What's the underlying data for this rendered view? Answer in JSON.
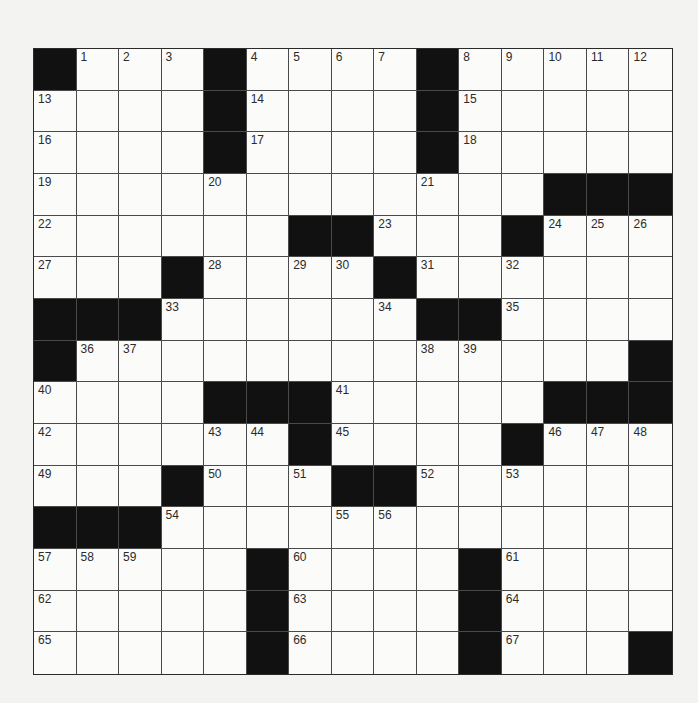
{
  "puzzle": {
    "rows": 15,
    "cols": 15,
    "grid": [
      [
        "#",
        "1",
        "2",
        "3",
        "#",
        "4",
        "5",
        "6",
        "7",
        "#",
        "8",
        "9",
        "10",
        "11",
        "12"
      ],
      [
        "13",
        "",
        "",
        "",
        "#",
        "14",
        "",
        "",
        "",
        "#",
        "15",
        "",
        "",
        "",
        ""
      ],
      [
        "16",
        "",
        "",
        "",
        "#",
        "17",
        "",
        "",
        "",
        "#",
        "18",
        "",
        "",
        "",
        ""
      ],
      [
        "19",
        "",
        "",
        "",
        "20",
        "",
        "",
        "",
        "",
        "21",
        "",
        "",
        "#",
        "#",
        "#"
      ],
      [
        "22",
        "",
        "",
        "",
        "",
        "",
        "#",
        "#",
        "23",
        "",
        "",
        "#",
        "24",
        "25",
        "26"
      ],
      [
        "27",
        "",
        "",
        "#",
        "28",
        "",
        "29",
        "30",
        "#",
        "31",
        "",
        "32",
        "",
        "",
        ""
      ],
      [
        "#",
        "#",
        "#",
        "33",
        "",
        "",
        "",
        "",
        "34",
        "#",
        "#",
        "35",
        "",
        "",
        ""
      ],
      [
        "#",
        "36",
        "37",
        "",
        "",
        "",
        "",
        "",
        "",
        "38",
        "39",
        "",
        "",
        "",
        "#"
      ],
      [
        "40",
        "",
        "",
        "",
        "#",
        "#",
        "#",
        "41",
        "",
        "",
        "",
        "",
        "#",
        "#",
        "#"
      ],
      [
        "42",
        "",
        "",
        "",
        "43",
        "44",
        "#",
        "45",
        "",
        "",
        "",
        "#",
        "46",
        "47",
        "48"
      ],
      [
        "49",
        "",
        "",
        "#",
        "50",
        "",
        "51",
        "#",
        "#",
        "52",
        "",
        "53",
        "",
        "",
        ""
      ],
      [
        "#",
        "#",
        "#",
        "54",
        "",
        "",
        "",
        "55",
        "56",
        "",
        "",
        "",
        "",
        "",
        ""
      ],
      [
        "57",
        "58",
        "59",
        "",
        "",
        "#",
        "60",
        "",
        "",
        "",
        "#",
        "61",
        "",
        "",
        ""
      ],
      [
        "62",
        "",
        "",
        "",
        "",
        "#",
        "63",
        "",
        "",
        "",
        "#",
        "64",
        "",
        "",
        ""
      ],
      [
        "65",
        "",
        "",
        "",
        "",
        "#",
        "66",
        "",
        "",
        "",
        "#",
        "67",
        "",
        "",
        "#"
      ]
    ]
  }
}
